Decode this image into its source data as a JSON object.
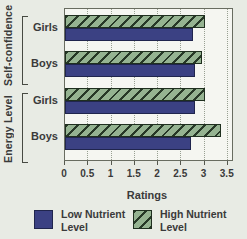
{
  "figure": {
    "background_color": "#e8ebe4",
    "plot_background_color": "#f5f6f1",
    "text_color": "#3a3a3a"
  },
  "axis": {
    "xlabel": "Ratings",
    "ticks": [
      0,
      0.5,
      1,
      1.5,
      2,
      2.5,
      3,
      3.5
    ],
    "tick_labels": [
      "0",
      "0.5",
      "1",
      "1.5",
      "2",
      "2.5",
      "3",
      "3.5"
    ]
  },
  "sections": [
    {
      "label": "Self-confidence"
    },
    {
      "label": "Energy Level"
    }
  ],
  "chart_data": {
    "type": "bar",
    "orientation": "horizontal",
    "title": "",
    "xlabel": "Ratings",
    "ylabel": "",
    "xlim": [
      0,
      3.5
    ],
    "grid": "dotted vertical gridlines every 0.5",
    "legend_position": "bottom",
    "categories": [
      "Self-confidence Girls",
      "Self-confidence Boys",
      "Energy Level Girls",
      "Energy Level Boys"
    ],
    "series": [
      {
        "key": "high",
        "name": "High Nutrient Level",
        "color": "#95b391",
        "hatched": true,
        "hatch_color": "#273827",
        "values": [
          3.0,
          2.95,
          3.0,
          3.35
        ]
      },
      {
        "key": "low",
        "name": "Low Nutrient Level",
        "color": "#3b4183",
        "hatched": false,
        "values": [
          2.75,
          2.8,
          2.8,
          2.7
        ]
      }
    ],
    "groups": [
      {
        "section": "Self-confidence",
        "category": "Girls",
        "high": 3.0,
        "low": 2.75
      },
      {
        "section": "Self-confidence",
        "category": "Boys",
        "high": 2.95,
        "low": 2.8
      },
      {
        "section": "Energy Level",
        "category": "Girls",
        "high": 3.0,
        "low": 2.8
      },
      {
        "section": "Energy Level",
        "category": "Boys",
        "high": 3.35,
        "low": 2.7
      }
    ]
  },
  "legend": {
    "low": {
      "line1": "Low Nutrient",
      "line2": "Level"
    },
    "high": {
      "line1": "High Nutrient",
      "line2": "Level"
    }
  }
}
